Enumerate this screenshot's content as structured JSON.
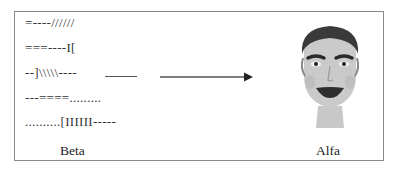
{
  "diagram": {
    "left_panel": {
      "lines": [
        "=----//////",
        "===----I[",
        "--]\\\\\\\\\\----",
        "---====.........",
        "..........[IIIIII-----"
      ],
      "caption": "Beta"
    },
    "right_panel": {
      "image": "cartoon-face",
      "caption": "Alfa"
    },
    "arrow": {
      "direction": "right",
      "from": "Beta",
      "to": "Alfa"
    },
    "colors": {
      "border": "#8a8a8a",
      "text": "#333333",
      "arrow": "#555555",
      "hair": "#3a3a3a",
      "skin": "#cfcfcf"
    }
  }
}
